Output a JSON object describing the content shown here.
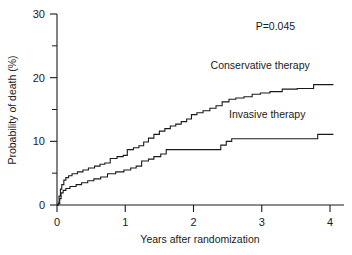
{
  "chart_data": {
    "type": "line",
    "subtype": "kaplan-meier-step",
    "title": "",
    "xlabel": "Years after randomization",
    "ylabel": "Probability of death (%)",
    "xlim": [
      0,
      4.15
    ],
    "ylim": [
      0,
      30
    ],
    "grid": false,
    "legend_position": "inline-above-curve",
    "xticks": [
      0,
      1,
      2,
      3,
      4
    ],
    "xtick_labels": [
      "0",
      "1",
      "2",
      "3",
      "4"
    ],
    "yticks": [
      0,
      10,
      20,
      30
    ],
    "ytick_labels": [
      "0",
      "10",
      "20",
      "30"
    ],
    "yticks_minor": [
      5,
      15,
      25
    ],
    "annotations": [
      {
        "name": "p-value",
        "text": "P=0.045",
        "x": 3.2,
        "y": 27.5
      }
    ],
    "series": [
      {
        "name": "Conservative therapy",
        "label": "Conservative therapy",
        "color": "#1a1a1a",
        "label_x": 2.25,
        "label_y": 21.4,
        "points": [
          [
            0.0,
            0.0
          ],
          [
            0.02,
            0.3
          ],
          [
            0.03,
            1.4
          ],
          [
            0.05,
            2.5
          ],
          [
            0.07,
            3.2
          ],
          [
            0.1,
            3.9
          ],
          [
            0.13,
            4.3
          ],
          [
            0.17,
            4.6
          ],
          [
            0.22,
            4.9
          ],
          [
            0.3,
            5.2
          ],
          [
            0.38,
            5.5
          ],
          [
            0.46,
            5.8
          ],
          [
            0.55,
            6.1
          ],
          [
            0.63,
            6.4
          ],
          [
            0.7,
            6.6
          ],
          [
            0.78,
            7.3
          ],
          [
            0.88,
            7.6
          ],
          [
            0.97,
            7.8
          ],
          [
            1.03,
            8.7
          ],
          [
            1.12,
            9.0
          ],
          [
            1.2,
            9.3
          ],
          [
            1.27,
            9.9
          ],
          [
            1.34,
            10.5
          ],
          [
            1.42,
            11.1
          ],
          [
            1.5,
            11.6
          ],
          [
            1.58,
            12.0
          ],
          [
            1.66,
            12.4
          ],
          [
            1.74,
            12.7
          ],
          [
            1.82,
            13.1
          ],
          [
            1.9,
            13.5
          ],
          [
            1.97,
            14.2
          ],
          [
            2.05,
            14.5
          ],
          [
            2.14,
            14.8
          ],
          [
            2.24,
            15.2
          ],
          [
            2.33,
            15.6
          ],
          [
            2.42,
            16.2
          ],
          [
            2.52,
            16.6
          ],
          [
            2.62,
            16.8
          ],
          [
            2.74,
            17.0
          ],
          [
            2.86,
            17.4
          ],
          [
            2.98,
            17.6
          ],
          [
            3.12,
            17.8
          ],
          [
            3.3,
            18.2
          ],
          [
            3.52,
            18.3
          ],
          [
            3.76,
            18.9
          ],
          [
            4.05,
            18.9
          ]
        ]
      },
      {
        "name": "Invasive therapy",
        "label": "Invasive therapy",
        "color": "#1a1a1a",
        "label_x": 2.52,
        "label_y": 13.6,
        "points": [
          [
            0.0,
            0.0
          ],
          [
            0.02,
            0.2
          ],
          [
            0.04,
            1.0
          ],
          [
            0.06,
            1.9
          ],
          [
            0.09,
            2.3
          ],
          [
            0.13,
            2.6
          ],
          [
            0.19,
            2.9
          ],
          [
            0.28,
            3.2
          ],
          [
            0.36,
            3.5
          ],
          [
            0.45,
            3.8
          ],
          [
            0.54,
            4.1
          ],
          [
            0.64,
            4.4
          ],
          [
            0.74,
            4.9
          ],
          [
            0.86,
            5.2
          ],
          [
            0.98,
            5.5
          ],
          [
            1.08,
            5.8
          ],
          [
            1.16,
            6.1
          ],
          [
            1.24,
            6.9
          ],
          [
            1.34,
            7.2
          ],
          [
            1.42,
            7.6
          ],
          [
            1.52,
            8.0
          ],
          [
            1.6,
            8.7
          ],
          [
            2.34,
            8.7
          ],
          [
            2.4,
            9.4
          ],
          [
            2.48,
            10.0
          ],
          [
            2.56,
            10.4
          ],
          [
            3.76,
            10.4
          ],
          [
            3.82,
            11.1
          ],
          [
            4.05,
            11.1
          ]
        ]
      }
    ]
  }
}
